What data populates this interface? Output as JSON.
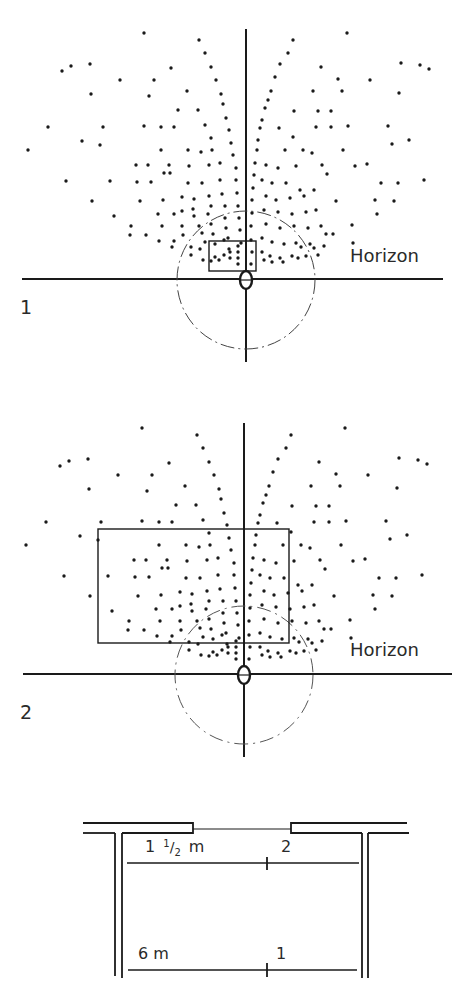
{
  "figure1": {
    "number_label": "1",
    "horizon_label": "Horizon",
    "offset_y": 0,
    "vertical_axis_x": 246,
    "horizon_y": 279,
    "rect": {
      "x": 209,
      "y": 241,
      "w": 47,
      "h": 30
    }
  },
  "figure2": {
    "number_label": "2",
    "horizon_label": "Horizon",
    "offset_y": 395,
    "vertical_axis_x": 244,
    "horizon_y": 674,
    "rect": {
      "x": 98,
      "y": 529,
      "w": 191,
      "h": 114
    }
  },
  "plan": {
    "distance_near_label": "1 ½ m",
    "distance_near_whole": "1",
    "distance_near_num": "1",
    "distance_near_den": "2",
    "distance_near_unit": "m",
    "position_near_label": "2",
    "distance_far_label": "6 m",
    "position_far_label": "1"
  },
  "colors": {
    "ink": "#1a1a1a",
    "dashed": "#444444",
    "background": "#ffffff"
  },
  "dots_left": [
    [
      144,
      33
    ],
    [
      199,
      40
    ],
    [
      205,
      53
    ],
    [
      62,
      71
    ],
    [
      71,
      66
    ],
    [
      90,
      64
    ],
    [
      211,
      67
    ],
    [
      171,
      68
    ],
    [
      120,
      80
    ],
    [
      154,
      80
    ],
    [
      216,
      80
    ],
    [
      187,
      91
    ],
    [
      91,
      94
    ],
    [
      221,
      94
    ],
    [
      149,
      96
    ],
    [
      178,
      110
    ],
    [
      198,
      110
    ],
    [
      223,
      104
    ],
    [
      226,
      118
    ],
    [
      48,
      127
    ],
    [
      103,
      127
    ],
    [
      144,
      126
    ],
    [
      161,
      127
    ],
    [
      174,
      127
    ],
    [
      205,
      125
    ],
    [
      229,
      130
    ],
    [
      82,
      141
    ],
    [
      100,
      145
    ],
    [
      211,
      138
    ],
    [
      28,
      150
    ],
    [
      161,
      150
    ],
    [
      188,
      150
    ],
    [
      201,
      152
    ],
    [
      212,
      150
    ],
    [
      231,
      143
    ],
    [
      136,
      165
    ],
    [
      148,
      165
    ],
    [
      169,
      165
    ],
    [
      189,
      166
    ],
    [
      209,
      165
    ],
    [
      220,
      163
    ],
    [
      233,
      155
    ],
    [
      164,
      173
    ],
    [
      170,
      173
    ],
    [
      236,
      168
    ],
    [
      66,
      181
    ],
    [
      110,
      181
    ],
    [
      137,
      182
    ],
    [
      151,
      182
    ],
    [
      188,
      183
    ],
    [
      202,
      183
    ],
    [
      220,
      180
    ],
    [
      236,
      180
    ],
    [
      92,
      201
    ],
    [
      140,
      201
    ],
    [
      163,
      200
    ],
    [
      182,
      197
    ],
    [
      194,
      199
    ],
    [
      209,
      196
    ],
    [
      222,
      194
    ],
    [
      237,
      193
    ],
    [
      182,
      211
    ],
    [
      193,
      209
    ],
    [
      211,
      206
    ],
    [
      225,
      206
    ],
    [
      238,
      206
    ],
    [
      114,
      216
    ],
    [
      131,
      226
    ],
    [
      158,
      214
    ],
    [
      174,
      214
    ],
    [
      194,
      216
    ],
    [
      208,
      214
    ],
    [
      225,
      218
    ],
    [
      239,
      218
    ],
    [
      146,
      235
    ],
    [
      162,
      226
    ],
    [
      182,
      226
    ],
    [
      199,
      226
    ],
    [
      211,
      224
    ],
    [
      226,
      228
    ],
    [
      240,
      230
    ],
    [
      130,
      235
    ],
    [
      183,
      235
    ],
    [
      202,
      233
    ],
    [
      213,
      234
    ],
    [
      228,
      238
    ],
    [
      241,
      243
    ],
    [
      159,
      241
    ],
    [
      174,
      241
    ],
    [
      205,
      242
    ],
    [
      215,
      244
    ],
    [
      224,
      240
    ],
    [
      238,
      246
    ],
    [
      172,
      247
    ],
    [
      191,
      247
    ],
    [
      200,
      249
    ],
    [
      229,
      249
    ],
    [
      238,
      252
    ],
    [
      191,
      255
    ],
    [
      215,
      257
    ],
    [
      224,
      255
    ],
    [
      230,
      252
    ],
    [
      238,
      258
    ],
    [
      203,
      260
    ],
    [
      211,
      261
    ],
    [
      219,
      260
    ],
    [
      230,
      258
    ],
    [
      238,
      264
    ]
  ],
  "dots_right": [
    [
      347,
      33
    ],
    [
      293,
      40
    ],
    [
      288,
      53
    ],
    [
      280,
      64
    ],
    [
      275,
      77
    ],
    [
      271,
      91
    ],
    [
      268,
      100
    ],
    [
      265,
      108
    ],
    [
      262,
      120
    ],
    [
      260,
      128
    ],
    [
      258,
      140
    ],
    [
      257,
      150
    ],
    [
      255,
      163
    ],
    [
      254,
      175
    ],
    [
      253,
      188
    ],
    [
      252,
      200
    ],
    [
      252,
      213
    ],
    [
      251,
      226
    ],
    [
      251,
      240
    ],
    [
      252,
      252
    ],
    [
      251,
      264
    ],
    [
      321,
      67
    ],
    [
      338,
      79
    ],
    [
      370,
      80
    ],
    [
      401,
      63
    ],
    [
      420,
      65
    ],
    [
      429,
      69
    ],
    [
      399,
      93
    ],
    [
      342,
      91
    ],
    [
      313,
      91
    ],
    [
      294,
      111
    ],
    [
      318,
      111
    ],
    [
      331,
      111
    ],
    [
      348,
      126
    ],
    [
      331,
      127
    ],
    [
      316,
      127
    ],
    [
      388,
      126
    ],
    [
      392,
      144
    ],
    [
      409,
      140
    ],
    [
      279,
      128
    ],
    [
      293,
      137
    ],
    [
      285,
      150
    ],
    [
      303,
      150
    ],
    [
      312,
      153
    ],
    [
      343,
      150
    ],
    [
      355,
      166
    ],
    [
      322,
      165
    ],
    [
      327,
      174
    ],
    [
      381,
      183
    ],
    [
      398,
      183
    ],
    [
      367,
      164
    ],
    [
      375,
      200
    ],
    [
      424,
      180
    ],
    [
      336,
      201
    ],
    [
      314,
      190
    ],
    [
      316,
      210
    ],
    [
      321,
      226
    ],
    [
      352,
      225
    ],
    [
      377,
      214
    ],
    [
      394,
      201
    ],
    [
      353,
      243
    ],
    [
      333,
      234
    ],
    [
      301,
      247
    ],
    [
      314,
      248
    ],
    [
      266,
      165
    ],
    [
      278,
      168
    ],
    [
      296,
      166
    ],
    [
      262,
      180
    ],
    [
      272,
      183
    ],
    [
      286,
      183
    ],
    [
      300,
      190
    ],
    [
      266,
      196
    ],
    [
      276,
      200
    ],
    [
      290,
      198
    ],
    [
      304,
      196
    ],
    [
      264,
      210
    ],
    [
      278,
      212
    ],
    [
      292,
      214
    ],
    [
      306,
      212
    ],
    [
      266,
      224
    ],
    [
      280,
      228
    ],
    [
      294,
      226
    ],
    [
      308,
      228
    ],
    [
      326,
      234
    ],
    [
      262,
      238
    ],
    [
      272,
      242
    ],
    [
      284,
      244
    ],
    [
      296,
      243
    ],
    [
      310,
      244
    ],
    [
      324,
      246
    ],
    [
      262,
      252
    ],
    [
      270,
      256
    ],
    [
      280,
      258
    ],
    [
      292,
      256
    ],
    [
      306,
      256
    ],
    [
      318,
      255
    ],
    [
      264,
      260
    ],
    [
      272,
      262
    ],
    [
      283,
      262
    ],
    [
      298,
      258
    ]
  ]
}
